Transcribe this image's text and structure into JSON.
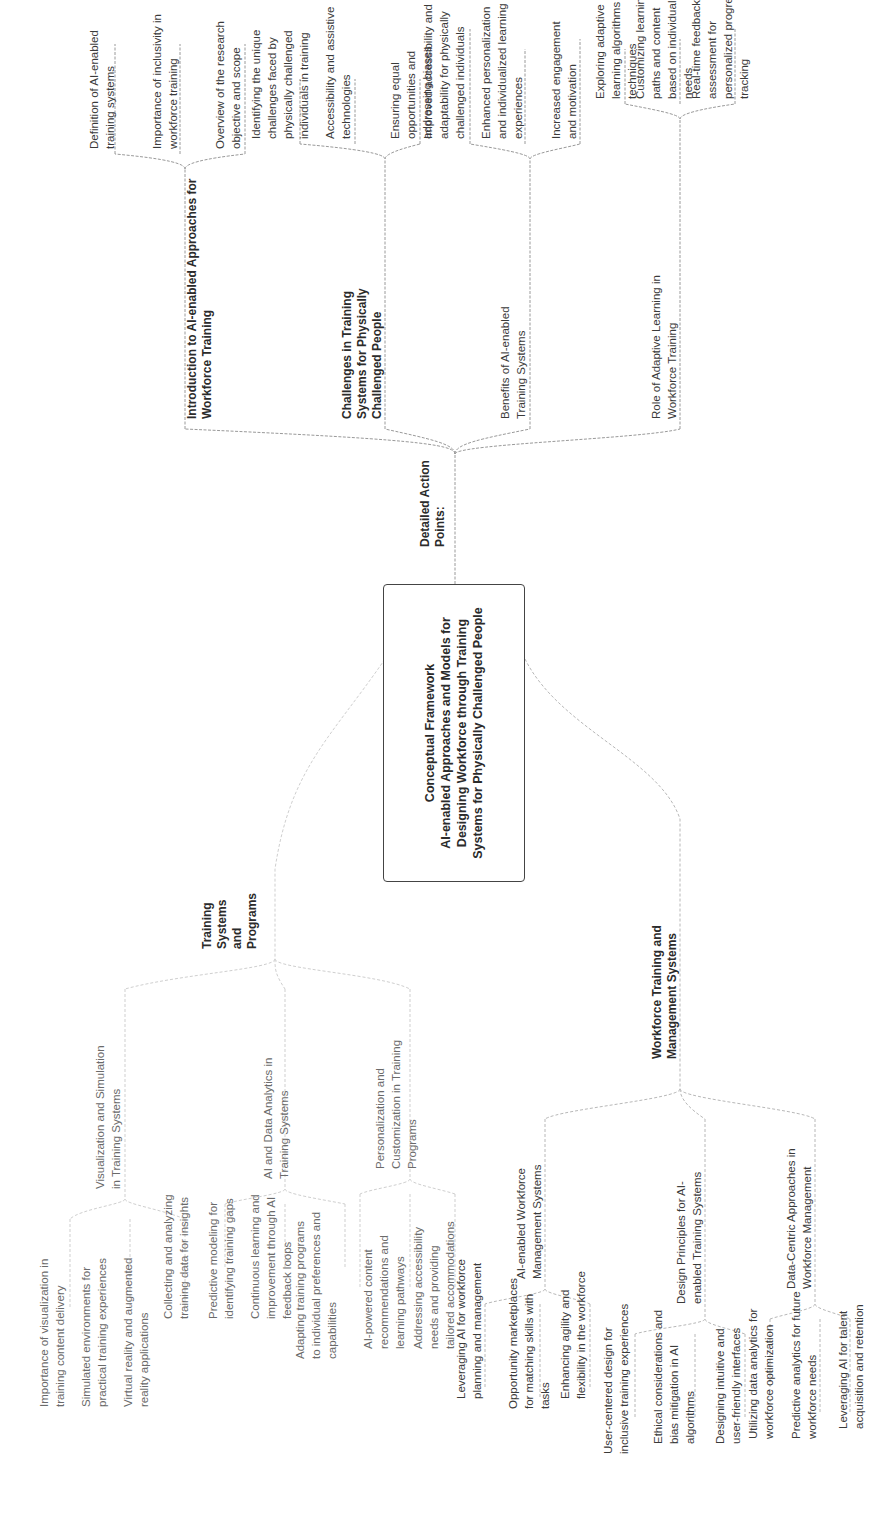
{
  "root": {
    "line1": "Conceptual Framework",
    "line2": "AI-enabled Approaches and Models for Designing Workforce through Training Systems for Physically Challenged People"
  },
  "branches": {
    "action_points": {
      "label": "Detailed Action Points:",
      "children": [
        {
          "label": "Introduction to AI-enabled Approaches for Workforce Training",
          "items": [
            "Definition of AI-enabled training systems",
            "Importance of inclusivity in workforce training",
            "Overview of the research objective and scope"
          ]
        },
        {
          "label": "Challenges in Training Systems for Physically Challenged People",
          "items": [
            "Identifying the unique challenges faced by physically challenged individuals in training",
            "Accessibility and assistive technologies",
            "Ensuring equal opportunities and addressing biases"
          ]
        },
        {
          "label": "Benefits of AI-enabled Training Systems",
          "items": [
            "Improved accessibility and adaptability for physically challenged individuals",
            "Enhanced personalization and individualized learning experiences",
            "Increased engagement and motivation"
          ]
        },
        {
          "label": "Role of Adaptive Learning in Workforce Training",
          "items": [
            "Exploring adaptive learning algorithms and techniques",
            "Customizing learning paths and content based on individual needs",
            "Real-time feedback and assessment for personalized progress tracking"
          ]
        }
      ]
    },
    "training_systems": {
      "label": "Training Systems and Programs",
      "children": [
        {
          "label": "Visualization and Simulation in Training Systems",
          "items": [
            "Importance of visualization in training content delivery",
            "Simulated environments for practical training experiences",
            "Virtual reality and augmented reality applications"
          ]
        },
        {
          "label": "AI and Data Analytics in Training Systems",
          "items": [
            "Collecting and analyzing training data for insights",
            "Predictive modeling for identifying training gaps",
            "Continuous learning and improvement through AI feedback loops"
          ]
        },
        {
          "label": "Personalization and Customization in Training Programs",
          "items": [
            "Adapting training programs to individual preferences and capabilities",
            "AI-powered content recommendations and learning pathways",
            "Addressing accessibility needs and providing tailored accommodations"
          ]
        }
      ]
    },
    "workforce_systems": {
      "label": "Workforce Training and Management Systems",
      "children": [
        {
          "label": "AI-enabled Workforce Management Systems",
          "items": [
            "Leveraging AI for workforce planning and management",
            "Opportunity marketplaces for matching skills with tasks",
            "Enhancing agility and flexibility in the workforce"
          ]
        },
        {
          "label": "Design Principles for AI-enabled Training Systems",
          "items": [
            "User-centered design for inclusive training experiences",
            "Ethical considerations and bias mitigation in AI algorithms",
            "Designing intuitive and user-friendly interfaces"
          ]
        },
        {
          "label": "Data-Centric Approaches in Workforce Management",
          "items": [
            "Utilizing data analytics for workforce optimization",
            "Predictive analytics for future workforce needs",
            "Leveraging AI for talent acquisition and retention"
          ]
        }
      ]
    }
  },
  "colors": {
    "line_dark": "#8a8a8a",
    "line_light": "#d0d0d0",
    "text": "#3a3a3a",
    "root_border": "#444444"
  }
}
